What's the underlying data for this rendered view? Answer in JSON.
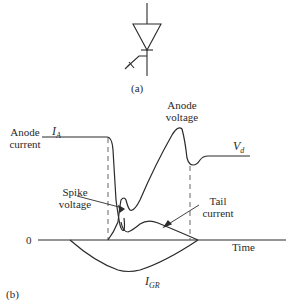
{
  "figure": {
    "part_a": {
      "label": "(a)",
      "symbol": "gate-turn-off-thyristor-symbol"
    },
    "part_b": {
      "label": "(b)",
      "axis": {
        "origin_label": "0",
        "x_label": "Time"
      },
      "curves": {
        "anode_current": {
          "label_line1": "Anode",
          "label_line2": "current",
          "symbol": "I",
          "symbol_sub": "A"
        },
        "anode_voltage": {
          "label_line1": "Anode",
          "label_line2": "voltage",
          "symbol": "V",
          "symbol_sub": "d"
        },
        "spike_voltage": {
          "label_line1": "Spike",
          "label_line2": "voltage"
        },
        "tail_current": {
          "label_line1": "Tail",
          "label_line2": "current"
        },
        "gate_current": {
          "symbol": "I",
          "symbol_sub": "GR"
        }
      }
    },
    "colors": {
      "stroke": "#2b2b2b",
      "dashed": "#555555",
      "background": "#ffffff"
    }
  }
}
